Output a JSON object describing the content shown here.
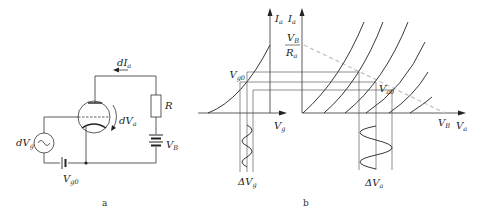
{
  "panel_a": {
    "caption": "a",
    "labels": {
      "dIa": {
        "main": "dI",
        "sub": "a"
      },
      "R": "R",
      "dVa": {
        "main": "dV",
        "sub": "a"
      },
      "VB": {
        "main": "V",
        "sub": "B"
      },
      "dVg": {
        "main": "dV",
        "sub": "g"
      },
      "Vg0": {
        "main": "V",
        "sub": "g0"
      }
    }
  },
  "panel_b": {
    "caption": "b",
    "left_axis_y": {
      "main": "I",
      "sub": "a"
    },
    "left_axis_x": {
      "main": "V",
      "sub": "g"
    },
    "right_axis_y": {
      "main": "I",
      "sub": "a"
    },
    "right_axis_x": {
      "main": "V",
      "sub": "a"
    },
    "load_intercept_y": {
      "num_main": "V",
      "num_sub": "B",
      "den_main": "R",
      "den_sub": "a"
    },
    "load_intercept_x": {
      "main": "V",
      "sub": "B"
    },
    "grid_op_point": {
      "main": "V",
      "sub": "g0"
    },
    "anode_op_point": {
      "main": "V",
      "sub": "a0"
    },
    "delta_vg": {
      "main": "ΔV",
      "sub": "g"
    },
    "delta_va": {
      "main": "ΔV",
      "sub": "a"
    }
  }
}
